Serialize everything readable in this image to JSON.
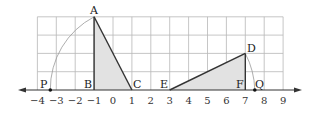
{
  "diagram": {
    "type": "number-line-with-grid",
    "colors": {
      "grid": "#b8b8b8",
      "axis": "#333333",
      "triangle_fill": "#e2e2e2",
      "triangle_stroke": "#333333",
      "arc": "#999999"
    },
    "axis": {
      "tick_labels": [
        "−4",
        "−3",
        "−2",
        "−1",
        "0",
        "1",
        "2",
        "3",
        "4",
        "5",
        "6",
        "7",
        "8",
        "9"
      ],
      "tick_values": [
        -4,
        -3,
        -2,
        -1,
        0,
        1,
        2,
        3,
        4,
        5,
        6,
        7,
        8,
        9
      ]
    },
    "points": {
      "A": {
        "label": "A",
        "x": -1,
        "y": 4
      },
      "B": {
        "label": "B",
        "x": -1,
        "y": 0
      },
      "C": {
        "label": "C",
        "x": 1,
        "y": 0
      },
      "D": {
        "label": "D",
        "x": 7,
        "y": 2
      },
      "E": {
        "label": "E",
        "x": 3,
        "y": 0
      },
      "F": {
        "label": "F",
        "x": 7,
        "y": 0
      },
      "P": {
        "label": "P",
        "x": -3.2,
        "y": 0
      },
      "Q": {
        "label": "Q",
        "x": 7.5,
        "y": 0
      }
    },
    "triangles": [
      {
        "name": "ABC",
        "vertices": [
          "A",
          "B",
          "C"
        ]
      },
      {
        "name": "DEF",
        "vertices": [
          "D",
          "E",
          "F"
        ]
      }
    ],
    "arcs": [
      {
        "center": "C",
        "from": "A",
        "to": "P"
      },
      {
        "center": "E",
        "from": "D",
        "to": "Q"
      }
    ]
  }
}
